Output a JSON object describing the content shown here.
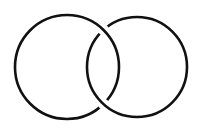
{
  "diagram": {
    "type": "interlocking-rings",
    "background": "#ffffff",
    "stroke_color": "#111111",
    "stroke_width": 2.6,
    "rings": [
      {
        "name": "left-ring",
        "cx": 67,
        "cy": 67,
        "r": 52
      },
      {
        "name": "right-ring",
        "cx": 137,
        "cy": 67,
        "r": 50
      }
    ],
    "crossings": [
      {
        "position": "top",
        "over": "left-ring",
        "under": "right-ring"
      },
      {
        "position": "bottom",
        "over": "right-ring",
        "under": "left-ring"
      }
    ]
  }
}
